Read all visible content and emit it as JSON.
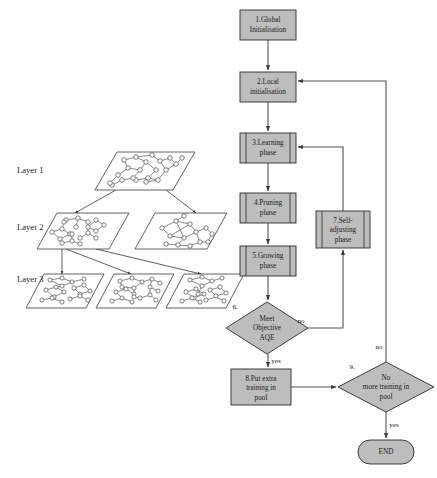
{
  "figure": {
    "type": "flowchart-with-layered-network-diagram",
    "background_color": "#ffffff",
    "shape_fill_color": "#bdbdbd",
    "shape_stroke_color": "#2a2a2a",
    "line_color": "#555555"
  },
  "network_diagram": {
    "layer_labels": [
      {
        "id": "layer-1",
        "text": "Layer 1"
      },
      {
        "id": "layer-2",
        "text": "Layer 2"
      },
      {
        "id": "layer-3",
        "text": "Layer 3"
      }
    ],
    "planes": [
      {
        "id": "l1-p1",
        "layer": 1,
        "x": 95,
        "y": 152,
        "w": 78,
        "h": 38,
        "skew": 22
      },
      {
        "id": "l2-p1",
        "layer": 2,
        "x": 37,
        "y": 213,
        "w": 72,
        "h": 36,
        "skew": 20
      },
      {
        "id": "l2-p2",
        "layer": 2,
        "x": 135,
        "y": 213,
        "w": 72,
        "h": 36,
        "skew": 20
      },
      {
        "id": "l3-p1",
        "layer": 3,
        "x": 26,
        "y": 274,
        "w": 60,
        "h": 34,
        "skew": 18
      },
      {
        "id": "l3-p2",
        "layer": 3,
        "x": 96,
        "y": 274,
        "w": 60,
        "h": 34,
        "skew": 18
      },
      {
        "id": "l3-p3",
        "layer": 3,
        "x": 166,
        "y": 274,
        "w": 60,
        "h": 34,
        "skew": 18
      }
    ]
  },
  "flowchart": {
    "nodes": [
      {
        "id": "n1",
        "shape": "process",
        "label": "1.Global\nInitialisation",
        "lines": [
          "1.Global",
          "Initialisation"
        ],
        "x": 240,
        "y": 10,
        "w": 56,
        "h": 30
      },
      {
        "id": "n2",
        "shape": "process",
        "label": "2.Local\ninitialisation",
        "lines": [
          "2.Local",
          "initialisation"
        ],
        "x": 240,
        "y": 72,
        "w": 56,
        "h": 30
      },
      {
        "id": "n3",
        "shape": "predefined-process",
        "label": "3.Learning\nphase",
        "lines": [
          "3.Learning",
          "phase"
        ],
        "x": 240,
        "y": 133,
        "w": 56,
        "h": 30
      },
      {
        "id": "n4",
        "shape": "predefined-process",
        "label": "4.Pruning\nphase",
        "lines": [
          "4.Pruning",
          "phase"
        ],
        "x": 240,
        "y": 193,
        "w": 56,
        "h": 30
      },
      {
        "id": "n5",
        "shape": "predefined-process",
        "label": "5.Growing\nphase",
        "lines": [
          "5.Growing",
          "phase"
        ],
        "x": 240,
        "y": 246,
        "w": 56,
        "h": 30
      },
      {
        "id": "n6",
        "shape": "decision",
        "number": "6.",
        "label": "Meet\nObjective\nAQE",
        "lines": [
          "Meet",
          "Objective",
          "AQE"
        ],
        "cx": 267,
        "cy": 328,
        "rx": 41,
        "ry": 26
      },
      {
        "id": "n7",
        "shape": "predefined-process",
        "label": "7.Self-\nadjusting\nphase",
        "lines": [
          "7.Self-",
          "adjusting",
          "phase"
        ],
        "x": 316,
        "y": 211,
        "w": 54,
        "h": 37
      },
      {
        "id": "n8",
        "shape": "process",
        "label": "8.Put extra\ntraining in\npool",
        "lines": [
          "8.Put extra",
          "training in",
          "pool"
        ],
        "x": 231,
        "y": 369,
        "w": 60,
        "h": 36
      },
      {
        "id": "n9",
        "shape": "decision",
        "number": "9.",
        "label": "No\nmore training in\npool",
        "lines": [
          "No",
          "more training in",
          "pool"
        ],
        "cx": 386,
        "cy": 387,
        "rx": 48,
        "ry": 25
      },
      {
        "id": "n10",
        "shape": "terminator",
        "label": "END",
        "lines": [
          "END"
        ],
        "x": 358,
        "y": 440,
        "w": 56,
        "h": 24
      }
    ],
    "edge_labels": [
      {
        "id": "e6-no",
        "text": "no",
        "x": 301,
        "y": 321
      },
      {
        "id": "e6-yes",
        "text": "yes",
        "x": 276,
        "y": 360
      },
      {
        "id": "e9-no",
        "text": "no",
        "x": 380,
        "y": 347
      },
      {
        "id": "e9-yes",
        "text": "yes",
        "x": 394,
        "y": 424
      }
    ],
    "edges": [
      {
        "from": "n1",
        "to": "n2",
        "label": ""
      },
      {
        "from": "n2",
        "to": "n3",
        "label": ""
      },
      {
        "from": "n3",
        "to": "n4",
        "label": ""
      },
      {
        "from": "n4",
        "to": "n5",
        "label": ""
      },
      {
        "from": "n5",
        "to": "n6",
        "label": ""
      },
      {
        "from": "n6",
        "to": "n7",
        "label": "no"
      },
      {
        "from": "n7",
        "to": "n3",
        "label": ""
      },
      {
        "from": "n6",
        "to": "n8",
        "label": "yes"
      },
      {
        "from": "n8",
        "to": "n9",
        "label": ""
      },
      {
        "from": "n9",
        "to": "n2",
        "label": "no"
      },
      {
        "from": "n9",
        "to": "n10",
        "label": "yes"
      }
    ]
  }
}
